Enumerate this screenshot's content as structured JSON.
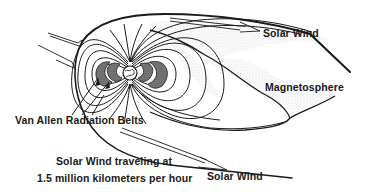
{
  "diagram": {
    "labels": {
      "solar_wind_top": "Solar Wind",
      "magnetosphere": "Magnetosphere",
      "van_allen": "Van Allen Radiation Belts",
      "travel_line1": "Solar Wind traveling at",
      "travel_line2": "1.5 million kilometers per hour",
      "solar_wind_bottom": "Solar Wind"
    },
    "colors": {
      "ink": "#1a1a1a",
      "background": "#ffffff",
      "stipple": "#555555"
    }
  }
}
